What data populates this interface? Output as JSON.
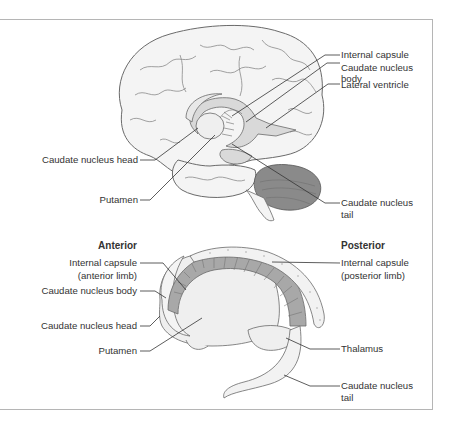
{
  "figure": {
    "top_panel": {
      "view": "lateral brain with basal nuclei",
      "labels_right": [
        {
          "id": "internal-capsule",
          "text": "Internal capsule"
        },
        {
          "id": "caudate-body",
          "text": "Caudate nucleus",
          "text2": "body"
        },
        {
          "id": "lateral-ventricle",
          "text": "Lateral ventricle"
        },
        {
          "id": "caudate-tail",
          "text": "Caudate nucleus",
          "text2": "tail"
        }
      ],
      "labels_left": [
        {
          "id": "caudate-head",
          "text": "Caudate nucleus head"
        },
        {
          "id": "putamen",
          "text": "Putamen"
        }
      ]
    },
    "bottom_panel": {
      "view": "isolated basal nuclei",
      "anterior_heading": "Anterior",
      "posterior_heading": "Posterior",
      "labels_left": [
        {
          "id": "ic-anterior",
          "text": "Internal capsule",
          "text2": "(anterior limb)"
        },
        {
          "id": "caudate-body",
          "text": "Caudate nucleus body"
        },
        {
          "id": "caudate-head",
          "text": "Caudate nucleus head"
        },
        {
          "id": "putamen",
          "text": "Putamen"
        }
      ],
      "labels_right": [
        {
          "id": "ic-posterior",
          "text": "Internal capsule",
          "text2": "(posterior limb)"
        },
        {
          "id": "thalamus",
          "text": "Thalamus"
        },
        {
          "id": "caudate-tail",
          "text": "Caudate nucleus",
          "text2": "tail"
        }
      ]
    },
    "colors": {
      "brain_fill": "#f4f4f4",
      "brain_stroke": "#6a6a6a",
      "structure_fill": "#d9d9d9",
      "dark_fill": "#8a8a8a",
      "leader_line": "#333333",
      "border": "#b5b5b5"
    }
  }
}
